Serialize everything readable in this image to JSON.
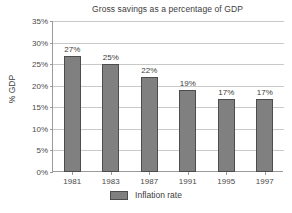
{
  "chart_data": {
    "type": "bar",
    "title": "Gross savings as a percentage of GDP",
    "xlabel": "",
    "ylabel": "% GDP",
    "categories": [
      "1981",
      "1983",
      "1987",
      "1991",
      "1995",
      "1997"
    ],
    "values": [
      27,
      25,
      22,
      19,
      17,
      17
    ],
    "data_labels": [
      "27%",
      "25%",
      "22%",
      "19%",
      "17%",
      "17%"
    ],
    "ylim": [
      0,
      35
    ],
    "ytick_values": [
      0,
      5,
      10,
      15,
      20,
      25,
      30,
      35
    ],
    "ytick_labels": [
      "0%",
      "5%",
      "10%",
      "15%",
      "20%",
      "25%",
      "30%",
      "35%"
    ],
    "grid": true,
    "legend_position": "bottom",
    "series": [
      {
        "name": "Inflation rate",
        "color": "#808080",
        "border_color": "#4d4d4d",
        "values": [
          27,
          25,
          22,
          19,
          17,
          17
        ]
      }
    ]
  },
  "legend": {
    "entries": [
      {
        "label": "Inflation rate",
        "color": "#808080"
      }
    ]
  },
  "colors": {
    "background": "#ffffff",
    "bar_fill": "#808080",
    "bar_border": "#4d4d4d",
    "gridline": "#c9c9c9",
    "axis": "#9a9a9a",
    "text": "#3c3c3c"
  }
}
